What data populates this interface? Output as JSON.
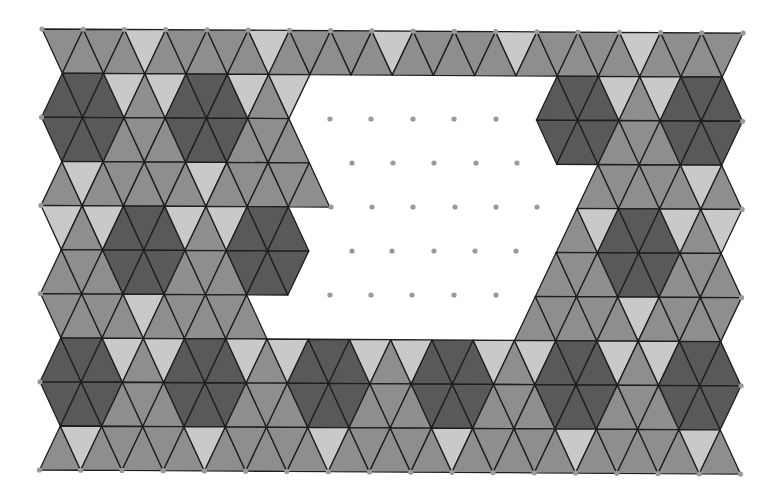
{
  "diagram": {
    "colors": {
      "L": "#c9c9c9",
      "M": "#8e8e8e",
      "D": "#595959",
      "stroke": "#1e1e1e",
      "dot": "#9a9a9a",
      "background": "#ffffff"
    },
    "lattice": {
      "origin_x": 42,
      "origin_y": 29,
      "spacing": 41.24,
      "row_height": 44.1,
      "rows": 10,
      "triangles_per_row": 33,
      "rotation_deg": 0.33
    },
    "legend": {
      "L": "light triangle",
      "M": "medium triangle",
      "D": "dark triangle",
      ".": "empty (hole)"
    },
    "rows": [
      "MMMMLMMMMMLMMMMMLMMMMMLMMMMMLMMMM",
      "DDDLMLDDDLML............DDDLMLDDD",
      "DDDMMMDDDMMM............DDDMMMDDD",
      "MLMMMMMLMMMMM.............MMMMMLM",
      "LMLDDDLMLDDD.............MLDDDLML",
      "MMMDDDMMMDDD............MMMDDDMMM",
      "MMMMLMMMMM.............MMMMMLMMMM",
      "DDDLMLDDDLMLDDDLMLDDDLMLDDDLMLDDD",
      "DDDMMMDDDMMMDDDMMMDDDMMMDDDMMMDDD",
      "MLMMMMMLMMMMMLMMMMMLMMMMMLMMMMMLM"
    ],
    "hole_dots": [
      [
        330,
        119
      ],
      [
        371,
        119
      ],
      [
        413,
        119
      ],
      [
        454,
        119
      ],
      [
        496,
        119
      ],
      [
        352,
        163
      ],
      [
        393,
        163
      ],
      [
        434,
        163
      ],
      [
        476,
        163
      ],
      [
        517,
        163
      ],
      [
        331,
        207
      ],
      [
        372,
        207
      ],
      [
        413,
        207
      ],
      [
        455,
        207
      ],
      [
        496,
        207
      ],
      [
        537,
        207
      ],
      [
        352,
        251
      ],
      [
        392,
        251
      ],
      [
        434,
        251
      ],
      [
        475,
        251
      ],
      [
        516,
        251
      ],
      [
        330,
        295
      ],
      [
        371,
        295
      ],
      [
        412,
        295
      ],
      [
        454,
        295
      ],
      [
        496,
        295
      ]
    ]
  }
}
